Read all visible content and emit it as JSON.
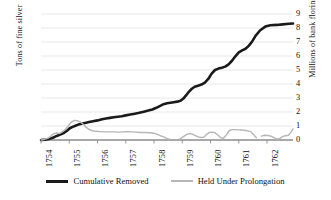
{
  "chart_data": {
    "type": "line",
    "title": "",
    "xlabel": "",
    "ylabel": "Tons of fine silver",
    "y2label": "Millions of bank florins",
    "grid": true,
    "legend_position": "bottom",
    "xlim": [
      1754,
      1762.92
    ],
    "ylim": [
      0,
      90
    ],
    "y2lim": [
      0,
      9
    ],
    "xticks": [
      "1754",
      "1755",
      "1756",
      "1757",
      "1758",
      "1759",
      "1760",
      "1761",
      "1762"
    ],
    "xtick_values": [
      1754,
      1755,
      1756,
      1757,
      1758,
      1759,
      1760,
      1761,
      1762
    ],
    "yticks": [
      "0",
      "10",
      "20",
      "30",
      "40",
      "50",
      "60",
      "70",
      "80",
      "90"
    ],
    "ytick_values": [
      0,
      10,
      20,
      30,
      40,
      50,
      60,
      70,
      80,
      90
    ],
    "y2ticks": [
      "0",
      "1",
      "2",
      "3",
      "4",
      "5",
      "6",
      "7",
      "8",
      "9"
    ],
    "y2tick_values": [
      0,
      1,
      2,
      3,
      4,
      5,
      6,
      7,
      8,
      9
    ],
    "axis_ratio_note": "10 tons of fine silver = 1 million bank florins",
    "series": [
      {
        "name": "Cumulative Removed",
        "color": "#1a1a1a",
        "width": 2.6,
        "x": [
          1754.0,
          1754.18,
          1754.3,
          1754.42,
          1754.52,
          1754.62,
          1754.72,
          1754.82,
          1754.92,
          1755.02,
          1755.12,
          1755.22,
          1755.32,
          1755.44,
          1755.56,
          1755.7,
          1755.84,
          1756.0,
          1756.16,
          1756.3,
          1756.44,
          1756.58,
          1756.72,
          1756.86,
          1757.0,
          1757.16,
          1757.32,
          1757.48,
          1757.64,
          1757.8,
          1757.94,
          1758.08,
          1758.22,
          1758.34,
          1758.46,
          1758.58,
          1758.7,
          1758.82,
          1758.94,
          1759.04,
          1759.14,
          1759.24,
          1759.34,
          1759.44,
          1759.56,
          1759.68,
          1759.8,
          1759.92,
          1760.04,
          1760.16,
          1760.28,
          1760.4,
          1760.52,
          1760.64,
          1760.76,
          1760.88,
          1761.0,
          1761.12,
          1761.24,
          1761.36,
          1761.48,
          1761.6,
          1761.76,
          1761.94,
          1762.12,
          1762.34,
          1762.56,
          1762.78,
          1762.92
        ],
        "y": [
          0.0,
          0.3,
          0.8,
          1.6,
          2.6,
          3.4,
          4.2,
          5.2,
          6.6,
          8.4,
          9.4,
          10.2,
          11.0,
          11.6,
          12.2,
          12.8,
          13.4,
          14.0,
          14.8,
          15.4,
          15.8,
          16.2,
          16.6,
          17.0,
          17.6,
          18.2,
          18.8,
          19.4,
          20.2,
          21.0,
          21.8,
          23.0,
          24.4,
          25.6,
          26.2,
          26.6,
          27.0,
          27.4,
          28.0,
          29.6,
          32.0,
          34.6,
          36.6,
          38.0,
          38.8,
          39.6,
          41.0,
          43.6,
          47.4,
          50.0,
          51.0,
          51.6,
          52.4,
          54.0,
          56.6,
          59.8,
          62.6,
          64.0,
          65.2,
          67.4,
          70.6,
          74.6,
          78.4,
          81.0,
          82.0,
          82.2,
          82.6,
          83.0,
          83.2
        ]
      },
      {
        "name": "Held Under Prolongation",
        "color": "#b6b6b6",
        "width": 1.4,
        "gaps": true,
        "segments": [
          {
            "x": [
              1754.0,
              1754.12,
              1754.24,
              1754.34,
              1754.44,
              1754.54,
              1754.64,
              1754.74,
              1754.84,
              1754.94,
              1755.02,
              1755.1,
              1755.18,
              1755.28,
              1755.38,
              1755.48,
              1755.58,
              1755.7,
              1755.82,
              1755.94,
              1756.08,
              1756.24,
              1756.4,
              1756.56,
              1756.72,
              1756.88,
              1757.04,
              1757.2,
              1757.36,
              1757.52,
              1757.68,
              1757.84,
              1758.0,
              1758.12,
              1758.24,
              1758.36,
              1758.46,
              1758.56
            ],
            "y": [
              0.0,
              0.4,
              1.2,
              2.6,
              4.4,
              5.0,
              4.6,
              5.6,
              7.2,
              9.4,
              11.6,
              13.2,
              14.0,
              13.8,
              13.0,
              11.4,
              9.4,
              7.6,
              6.6,
              6.2,
              6.0,
              5.8,
              5.8,
              5.8,
              5.6,
              5.8,
              6.0,
              5.8,
              5.6,
              5.4,
              5.4,
              5.2,
              4.8,
              4.0,
              3.0,
              2.0,
              1.0,
              0.4
            ]
          },
          {
            "x": [
              1758.92,
              1759.04,
              1759.16,
              1759.26,
              1759.36,
              1759.46,
              1759.56,
              1759.66,
              1759.76,
              1759.86,
              1759.96,
              1760.06,
              1760.16,
              1760.26,
              1760.36,
              1760.46,
              1760.56,
              1760.66,
              1760.76,
              1760.86,
              1760.96,
              1761.06
            ],
            "y": [
              0.6,
              2.4,
              4.0,
              4.6,
              4.2,
              3.2,
              2.2,
              1.8,
              2.0,
              4.0,
              5.4,
              5.6,
              5.2,
              3.6,
              1.6,
              1.2,
              3.6,
              6.6,
              7.4,
              7.4,
              7.2,
              7.2
            ]
          },
          {
            "x": [
              1761.06,
              1761.18,
              1761.3,
              1761.42,
              1761.52,
              1761.62
            ],
            "y": [
              7.2,
              7.0,
              6.6,
              6.0,
              4.0,
              1.6
            ]
          },
          {
            "x": [
              1761.8,
              1761.92,
              1762.04,
              1762.16,
              1762.26,
              1762.36,
              1762.46,
              1762.56,
              1762.66,
              1762.76,
              1762.86,
              1762.92
            ],
            "y": [
              2.8,
              3.4,
              3.2,
              2.6,
              1.6,
              0.6,
              1.2,
              2.6,
              3.0,
              3.4,
              5.8,
              8.0
            ]
          }
        ]
      }
    ]
  },
  "legend": {
    "items": [
      {
        "label": "Cumulative Removed",
        "style": "black"
      },
      {
        "label": "Held Under Prolongation",
        "style": "gray"
      }
    ]
  }
}
